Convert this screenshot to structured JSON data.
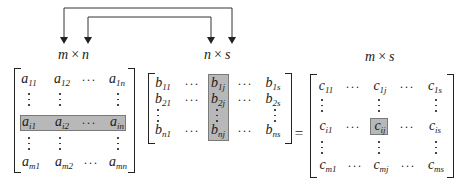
{
  "dimensions": {
    "a": {
      "left": "m",
      "op": "×",
      "right": "n"
    },
    "b": {
      "left": "n",
      "op": "×",
      "right": "s"
    },
    "c": {
      "left": "m",
      "op": "×",
      "right": "s"
    }
  },
  "matrix_a": {
    "row1": [
      {
        "v": "a",
        "s": "11"
      },
      {
        "v": "a",
        "s": "12"
      },
      {
        "dots": "···"
      },
      {
        "v": "a",
        "s": "1n"
      }
    ],
    "rowi": [
      {
        "v": "a",
        "s": "i1"
      },
      {
        "v": "a",
        "s": "i2"
      },
      {
        "dots": "···"
      },
      {
        "v": "a",
        "s": "in"
      }
    ],
    "rowm": [
      {
        "v": "a",
        "s": "m1"
      },
      {
        "v": "a",
        "s": "m2"
      },
      {
        "dots": "···"
      },
      {
        "v": "a",
        "s": "mn"
      }
    ],
    "highlight": "row i"
  },
  "matrix_b": {
    "row1": [
      {
        "v": "b",
        "s": "11"
      },
      {
        "dots": "···"
      },
      {
        "v": "b",
        "s": "1j"
      },
      {
        "dots": "···"
      },
      {
        "v": "b",
        "s": "1s"
      }
    ],
    "row2": [
      {
        "v": "b",
        "s": "21"
      },
      {
        "dots": "···"
      },
      {
        "v": "b",
        "s": "2j"
      },
      {
        "dots": "···"
      },
      {
        "v": "b",
        "s": "2s"
      }
    ],
    "rown": [
      {
        "v": "b",
        "s": "n1"
      },
      {
        "dots": "···"
      },
      {
        "v": "b",
        "s": "nj"
      },
      {
        "dots": "···"
      },
      {
        "v": "b",
        "s": "ns"
      }
    ],
    "highlight": "column j"
  },
  "matrix_c": {
    "row1": [
      {
        "v": "c",
        "s": "11"
      },
      {
        "dots": "···"
      },
      {
        "v": "c",
        "s": "1j"
      },
      {
        "dots": "···"
      },
      {
        "v": "c",
        "s": "1s"
      }
    ],
    "rowi": [
      {
        "v": "c",
        "s": "i1"
      },
      {
        "dots": "···"
      },
      {
        "v": "c",
        "s": "ij"
      },
      {
        "dots": "···"
      },
      {
        "v": "c",
        "s": "is"
      }
    ],
    "rowm": [
      {
        "v": "c",
        "s": "m1"
      },
      {
        "dots": "···"
      },
      {
        "v": "c",
        "s": "mj"
      },
      {
        "dots": "···"
      },
      {
        "v": "c",
        "s": "ms"
      }
    ],
    "highlight": "cell ij"
  },
  "equals": "=",
  "colors": {
    "highlight_fill": "#b8b8b8",
    "highlight_border": "#7a7a7a",
    "ink": "#1a1a1a"
  }
}
